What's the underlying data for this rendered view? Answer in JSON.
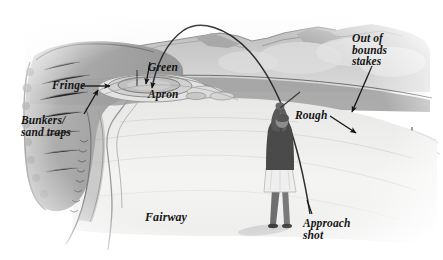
{
  "illustration": {
    "title": "Golf hole diagram",
    "medium": "grayscale pen and wash illustration",
    "background_color": "#ffffff",
    "ink_color": "#141414"
  },
  "labels": {
    "green": "Green",
    "apron": "Apron",
    "fringe": "Fringe",
    "bunkers": "Bunkers/\nsand traps",
    "rough": "Rough",
    "out_of_bounds": "Out of\nbounds\nstakes",
    "fairway": "Fairway",
    "approach_shot": "Approach\nshot"
  },
  "features": {
    "ball_flight_arc": "approach shot trajectory arc",
    "golfer": "golfer at follow-through",
    "flagstick": "flagstick on green",
    "stakes": "out of bounds stakes row",
    "cart_path": "fairway edge path",
    "hills": "background hills"
  },
  "palette": {
    "ink": "#141414",
    "dark_rough": "#8d8d8d",
    "mid_gray": "#b4b4b4",
    "light_gray": "#d8d8d8",
    "fairway": "#f0f0ef",
    "hill": "#c2c2c2",
    "golfer_shirt": "#4a4a4a",
    "golfer_skirt": "#efefef"
  }
}
